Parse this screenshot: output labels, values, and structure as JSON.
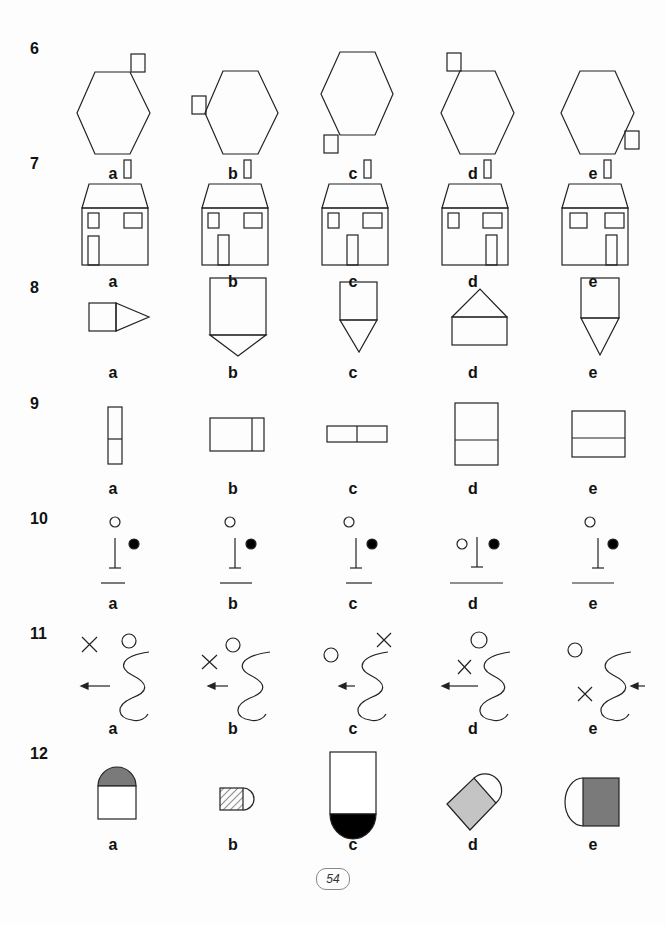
{
  "page": {
    "page_number": "54",
    "option_letters": [
      "a",
      "b",
      "c",
      "d",
      "e"
    ]
  },
  "questions": [
    {
      "number": "6",
      "description": "Hexagon with a small square attached at one vertex",
      "options": [
        {
          "label": "a",
          "desc": "square at top-right vertex"
        },
        {
          "label": "b",
          "desc": "square at left vertex"
        },
        {
          "label": "c",
          "desc": "square at bottom-left vertex"
        },
        {
          "label": "d",
          "desc": "square at top-left vertex"
        },
        {
          "label": "e",
          "desc": "square at bottom-right vertex"
        }
      ]
    },
    {
      "number": "7",
      "description": "House with chimney, two windows and a door",
      "options": [
        {
          "label": "a",
          "desc": "door under left window"
        },
        {
          "label": "b",
          "desc": "door left-center"
        },
        {
          "label": "c",
          "desc": "door center"
        },
        {
          "label": "d",
          "desc": "door right-center"
        },
        {
          "label": "e",
          "desc": "door under right window, both windows wide"
        }
      ]
    },
    {
      "number": "8",
      "description": "Rectangle with triangle point",
      "options": [
        {
          "label": "a",
          "desc": "square with triangle pointing right"
        },
        {
          "label": "b",
          "desc": "tall rectangle with short triangle pointing down"
        },
        {
          "label": "c",
          "desc": "rectangle with triangle pointing down"
        },
        {
          "label": "d",
          "desc": "rectangle with triangle pointing up"
        },
        {
          "label": "e",
          "desc": "rectangle with long triangle pointing down"
        }
      ]
    },
    {
      "number": "9",
      "description": "Divided rectangles",
      "options": [
        {
          "label": "a",
          "desc": "thin vertical rectangle split horizontally"
        },
        {
          "label": "b",
          "desc": "rectangle split vertically near right"
        },
        {
          "label": "c",
          "desc": "flat rectangle split vertically at center"
        },
        {
          "label": "d",
          "desc": "tall rectangle split horizontally"
        },
        {
          "label": "e",
          "desc": "near-square split horizontally"
        }
      ]
    },
    {
      "number": "10",
      "description": "Circles, T-post and baseline",
      "options": [
        {
          "label": "a",
          "desc": "open circle above, filled circle right, short base line"
        },
        {
          "label": "b",
          "desc": "open circle above, filled circle right, medium base line"
        },
        {
          "label": "c",
          "desc": "open circle above, filled circle right, short base line"
        },
        {
          "label": "d",
          "desc": "open circle left, filled circle right, long base line"
        },
        {
          "label": "e",
          "desc": "open circle above, filled circle right, medium base line"
        }
      ]
    },
    {
      "number": "11",
      "description": "Cross, circle, arrow and wavy line",
      "options": [
        {
          "label": "a",
          "desc": "cross top-left, circle top, arrow left"
        },
        {
          "label": "b",
          "desc": "cross left, circle near wave, arrow left"
        },
        {
          "label": "c",
          "desc": "circle left, cross top-right, short arrow"
        },
        {
          "label": "d",
          "desc": "circle top, cross left, long arrow"
        },
        {
          "label": "e",
          "desc": "circle top-left, cross bottom-left, arrow from right"
        }
      ]
    },
    {
      "number": "12",
      "description": "Square/rectangle with semicircle, shaded",
      "options": [
        {
          "label": "a",
          "desc": "semicircle on top shaded grey"
        },
        {
          "label": "b",
          "desc": "small hatched square with semicircle right"
        },
        {
          "label": "c",
          "desc": "tall rectangle with black semicircle below"
        },
        {
          "label": "d",
          "desc": "rotated light grey square with semicircle"
        },
        {
          "label": "e",
          "desc": "semicircle left with dark grey square"
        }
      ]
    }
  ],
  "colors": {
    "stroke": "#222222",
    "shade_dark": "#7a7a7a",
    "shade_light": "#c4c4c4",
    "fill_black": "#000000"
  }
}
